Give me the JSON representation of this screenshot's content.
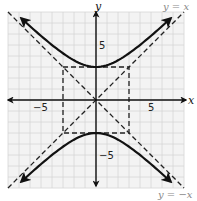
{
  "chart_data": {
    "type": "line",
    "title": "",
    "xlabel": "x",
    "ylabel": "y",
    "xlim": [
      -8,
      8
    ],
    "ylim": [
      -8,
      8
    ],
    "grid": true,
    "grid_step": 1,
    "x_ticks_labeled": [
      -5,
      5
    ],
    "y_ticks_labeled": [
      5,
      -5
    ],
    "x_tick_labels": [
      "−5",
      "5"
    ],
    "y_tick_labels": [
      "5",
      "−5"
    ],
    "series": [
      {
        "name": "hyperbola upper branch",
        "equation": "y^2/9 - x^2/9 = 1 (y > 0)",
        "style": "solid",
        "arrows": "both",
        "x_range": [
          -6.8,
          6.8
        ]
      },
      {
        "name": "hyperbola lower branch",
        "equation": "y^2/9 - x^2/9 = 1 (y < 0)",
        "style": "solid",
        "arrows": "both",
        "x_range": [
          -6.8,
          6.8
        ]
      },
      {
        "name": "asymptote y = x",
        "equation": "y = x",
        "style": "dashed",
        "x_range": [
          -8,
          8
        ]
      },
      {
        "name": "asymptote y = -x",
        "equation": "y = -x",
        "style": "dashed",
        "x_range": [
          -8,
          8
        ]
      },
      {
        "name": "central rectangle",
        "style": "dashed",
        "corners": [
          [
            -3,
            3
          ],
          [
            3,
            3
          ],
          [
            3,
            -3
          ],
          [
            -3,
            -3
          ]
        ]
      }
    ],
    "vertices": [
      [
        0,
        3
      ],
      [
        0,
        -3
      ]
    ],
    "annotations": [
      {
        "text": "y = x",
        "position": "top-right"
      },
      {
        "text": "y = −x",
        "position": "bottom-right"
      }
    ]
  },
  "labels": {
    "x_axis": "x",
    "y_axis": "y",
    "x_neg5": "−5",
    "x_pos5": "5",
    "y_pos5": "5",
    "y_neg5": "−5",
    "asym1": "y = x",
    "asym2": "y = −x"
  },
  "colors": {
    "grid_bg": "#f3f3f3",
    "grid_line": "#d6d6d6",
    "curve": "#111111",
    "annotation": "#888888"
  }
}
